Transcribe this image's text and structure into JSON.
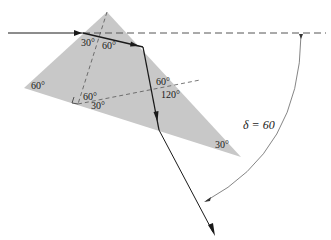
{
  "diagram": {
    "colors": {
      "prism_fill": "#c8c8c8",
      "ray": "#1a1a1a",
      "dashed": "#555555",
      "arc": "#666666",
      "background": "#ffffff"
    },
    "prism": {
      "vertices": [
        [
          107,
          12
        ],
        [
          24,
          88
        ],
        [
          241,
          157
        ]
      ],
      "corner_labels": {
        "left": "60°",
        "bottom_right": "30°"
      }
    },
    "angle_labels": {
      "entry_left": "30°",
      "entry_right": "60°",
      "reflect_upper": "60°",
      "reflect_lower": "120°",
      "perp_upper": "60°",
      "perp_lower": "30°"
    },
    "deviation": {
      "label": "δ = 60"
    }
  }
}
